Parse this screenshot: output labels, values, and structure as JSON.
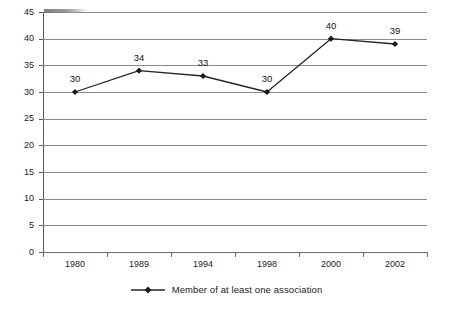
{
  "chart_data": {
    "type": "line",
    "title": "",
    "xlabel": "",
    "ylabel": "",
    "categories": [
      "1980",
      "1989",
      "1994",
      "1998",
      "2000",
      "2002"
    ],
    "series": [
      {
        "name": "Member of at least one association",
        "values": [
          30,
          34,
          33,
          30,
          40,
          39
        ],
        "marker": "diamond",
        "color": "#262626"
      }
    ],
    "data_labels": [
      "30",
      "34",
      "33",
      "30",
      "40",
      "39"
    ],
    "ylim": [
      0,
      45
    ],
    "ytick_step": 5,
    "yticks": [
      "0",
      "5",
      "10",
      "15",
      "20",
      "25",
      "30",
      "35",
      "40",
      "45"
    ],
    "grid": "horizontal",
    "legend_position": "bottom-center",
    "legend_entries": [
      "Member of at least one association"
    ],
    "colors": {
      "gridline": "#8a8a8a",
      "axis": "#5a5a5a",
      "series_line": "#262626",
      "marker": "#1a1a1a",
      "text": "#1a1a1a",
      "background": "#ffffff"
    }
  }
}
